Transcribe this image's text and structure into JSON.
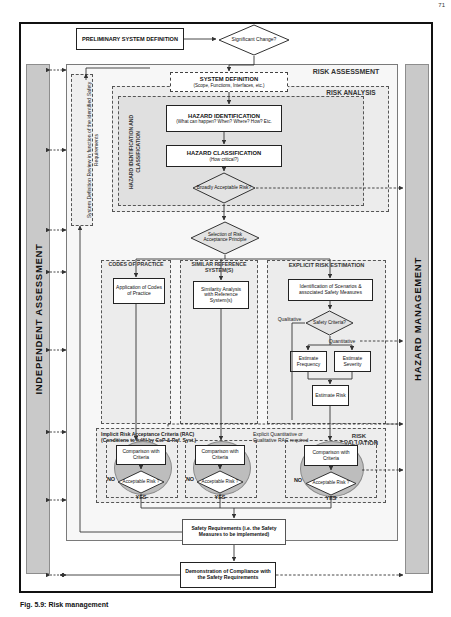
{
  "page": {
    "page_number": "71",
    "caption": "Fig. 5.9: Risk management"
  },
  "sidebars": {
    "left": {
      "label": "INDEPENDENT ASSESSMENT"
    },
    "right": {
      "label": "HAZARD MANAGEMENT"
    }
  },
  "regions": {
    "risk_assessment": "RISK ASSESSMENT",
    "risk_analysis": "RISK ANALYSIS",
    "hazard_id_class": "HAZARD IDENTIFICATION AND CLASSIFICATION",
    "codes_of_practice": "CODES OF PRACTICE",
    "similar_reference_systems": "SIMILAR REFERENCE SYSTEM(S)",
    "explicit_risk_estimation": "EXPLICIT RISK ESTIMATION",
    "risk_evaluation": "RISK EVALUATION"
  },
  "boxes": {
    "preliminary_system_definition": "PRELIMINARY SYSTEM DEFINITION",
    "system_definition_title": "SYSTEM DEFINITION",
    "system_definition_sub": "(Scope, Functions, Interfaces, etc.)",
    "hazard_identification_title": "HAZARD IDENTIFICATION",
    "hazard_identification_sub": "(What can happen? When? Where? How? Etc.",
    "hazard_classification_title": "HAZARD CLASSIFICATION",
    "hazard_classification_sub": "(How critical?)",
    "application_of_cop": "Application of Codes of Practice",
    "similarity_analysis": "Similarity Analysis with Reference System(s)",
    "identification_scenarios": "Identification of Scenarios & associated Safety Measures",
    "estimate_frequency": "Estimate Frequency",
    "estimate_severity": "Estimate Severity",
    "estimate_risk": "Estimate Risk",
    "comparison_with_criteria_1": "Comparison with Criteria",
    "comparison_with_criteria_2": "Comparison with Criteria",
    "comparison_with_criteria_3": "Comparison with Criteria",
    "safety_requirements": "Safety Requirements (i.e. the Safety Measures to be implemented)",
    "demonstration_of_compliance": "Demonstration of Compliance with the Safety Requirements"
  },
  "diamonds": {
    "significant_change": "Significant Change?",
    "broadly_acceptable_risk": "Broadly Acceptable Risk?",
    "selection_rap": "Selection of Risk Acceptance Principle",
    "safety_criteria": "Safety Criteria?",
    "acceptable_risk_1": "Acceptable Risk ?",
    "acceptable_risk_2": "Acceptable Risk ?",
    "acceptable_risk_3": "Acceptable Risk ?"
  },
  "edge_labels": {
    "yes_significant_change": "YES",
    "yes_broadly_acceptable": "YES",
    "no_broadly_acceptable": "NO",
    "qualitative": "Qualitative",
    "quantitative": "Quantitative",
    "no_1": "NO",
    "yes_1": "YES",
    "no_2": "NO",
    "yes_2": "YES",
    "no_3": "NO",
    "yes_3": "YES"
  },
  "annotations": {
    "system_definition_review": "System Definition Review in function of the identified Safety Requirements",
    "implicit_rac_line1": "Implicit Risk Acceptance Criteria (RAC)",
    "implicit_rac_line2": "(Conditions to fulfil by CoP & Ref. Syst.)",
    "explicit_rac_line1": "Explicit Quantitative or",
    "explicit_rac_line2": "Qualitative RAC required"
  },
  "colors": {
    "sidebar_fill": "#c9c9c9",
    "ellipse_fill": "#bdbdbd",
    "panel_fill": "rgba(0,0,0,0.055)",
    "line": "#333333",
    "frame": "#111111"
  }
}
